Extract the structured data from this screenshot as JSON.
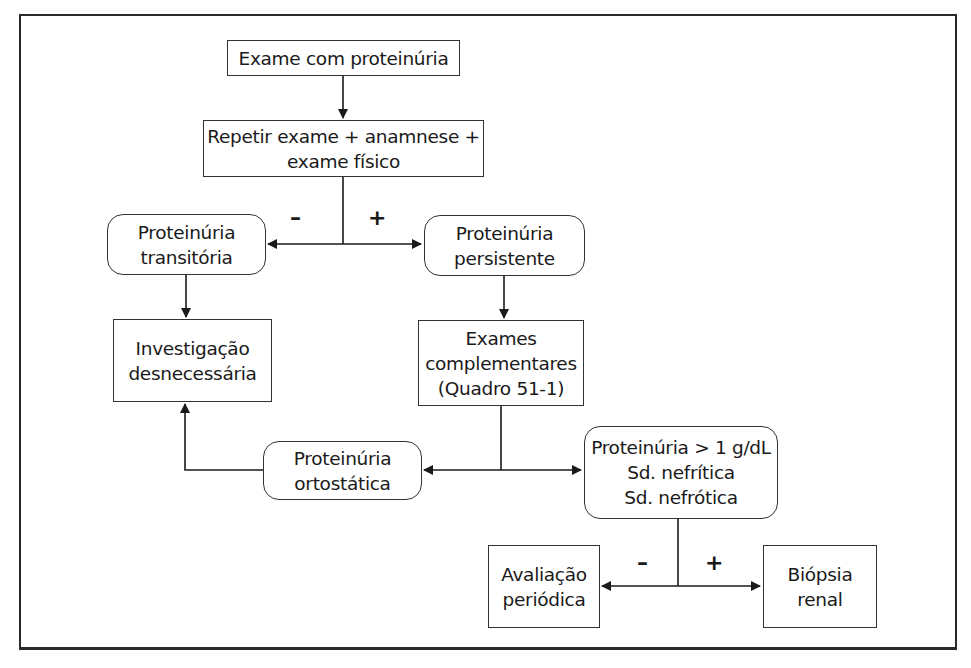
{
  "diagram": {
    "type": "flowchart",
    "nodes": {
      "start": {
        "lines": [
          "Exame com proteinúria"
        ],
        "shape": "rect"
      },
      "repeat": {
        "lines": [
          "Repetir exame + anamnese +",
          "exame físico"
        ],
        "shape": "rect"
      },
      "transient": {
        "lines": [
          "Proteinúria",
          "transitória"
        ],
        "shape": "rounded"
      },
      "persistent": {
        "lines": [
          "Proteinúria",
          "persistente"
        ],
        "shape": "rounded"
      },
      "unnecessary": {
        "lines": [
          "Investigação",
          "desnecessária"
        ],
        "shape": "rect"
      },
      "complementary": {
        "lines": [
          "Exames",
          "complementares",
          "(Quadro 51-1)"
        ],
        "shape": "rect"
      },
      "orthostatic": {
        "lines": [
          "Proteinúria",
          "ortostática"
        ],
        "shape": "rounded"
      },
      "severe": {
        "lines": [
          "Proteinúria > 1 g/dL",
          "Sd. nefrítica",
          "Sd. nefrótica"
        ],
        "shape": "rounded"
      },
      "periodic": {
        "lines": [
          "Avaliação",
          "periódica"
        ],
        "shape": "rect"
      },
      "biopsy": {
        "lines": [
          "Biópsia",
          "renal"
        ],
        "shape": "rect"
      }
    },
    "branch_labels": {
      "repeat_negative": "–",
      "repeat_positive": "+",
      "severe_negative": "–",
      "severe_positive": "+"
    },
    "edges": [
      {
        "from": "start",
        "to": "repeat"
      },
      {
        "from": "repeat",
        "to": "transient",
        "label": "–"
      },
      {
        "from": "repeat",
        "to": "persistent",
        "label": "+"
      },
      {
        "from": "transient",
        "to": "unnecessary"
      },
      {
        "from": "persistent",
        "to": "complementary"
      },
      {
        "from": "complementary",
        "to": "orthostatic"
      },
      {
        "from": "complementary",
        "to": "severe"
      },
      {
        "from": "orthostatic",
        "to": "unnecessary"
      },
      {
        "from": "severe",
        "to": "periodic",
        "label": "–"
      },
      {
        "from": "severe",
        "to": "biopsy",
        "label": "+"
      }
    ],
    "colors": {
      "line": "#1a1a1a",
      "border": "#333333",
      "background": "#ffffff"
    }
  }
}
